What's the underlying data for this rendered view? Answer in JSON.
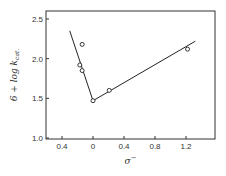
{
  "chart_data": {
    "type": "scatter",
    "title": "",
    "xlabel": "σ⁻",
    "ylabel": "6 + log k_cat.",
    "xlim": [
      -0.6,
      1.55
    ],
    "ylim": [
      1.0,
      2.6
    ],
    "x_ticks": [
      -0.4,
      0,
      0.4,
      0.8,
      1.2
    ],
    "x_tick_labels": [
      "0.4",
      "0",
      "0.4",
      "0.8",
      "1.2"
    ],
    "y_ticks": [
      1.0,
      1.5,
      2.0,
      2.5
    ],
    "y_tick_labels": [
      "1.0",
      "1.5",
      "2.0",
      "2.5"
    ],
    "grid": false,
    "legend": null,
    "series": [
      {
        "name": "data points",
        "marker": "open-circle",
        "points": [
          {
            "x": -0.14,
            "y": 2.18
          },
          {
            "x": -0.17,
            "y": 1.92
          },
          {
            "x": -0.14,
            "y": 1.85
          },
          {
            "x": 0.0,
            "y": 1.47
          },
          {
            "x": 0.21,
            "y": 1.6
          },
          {
            "x": 1.22,
            "y": 2.12
          }
        ]
      }
    ],
    "lines": [
      {
        "name": "negative-slope fit",
        "from": {
          "x": -0.3,
          "y": 2.35
        },
        "to": {
          "x": 0.0,
          "y": 1.47
        }
      },
      {
        "name": "positive-slope fit",
        "from": {
          "x": 0.0,
          "y": 1.47
        },
        "to": {
          "x": 1.32,
          "y": 2.22
        }
      }
    ]
  },
  "labels": {
    "ylabel_prefix": "6 + log ",
    "ylabel_k": "k",
    "ylabel_sub": "cat.",
    "xlabel_sigma": "σ",
    "xlabel_sup": "−"
  }
}
